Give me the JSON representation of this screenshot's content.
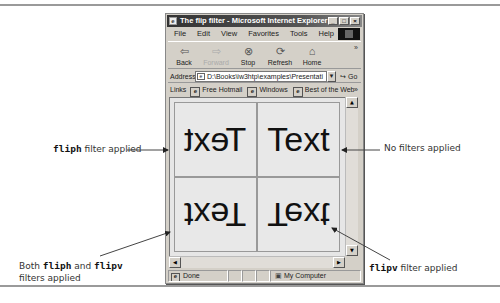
{
  "window": {
    "title": "The flip filter - Microsoft Internet Explorer",
    "buttons": [
      "_",
      "□",
      "×"
    ]
  },
  "menu": [
    "File",
    "Edit",
    "View",
    "Favorites",
    "Tools",
    "Help"
  ],
  "toolbar": {
    "back": {
      "label": "Back",
      "icon": "back-arrow-icon"
    },
    "forward": {
      "label": "Forward",
      "icon": "forward-arrow-icon"
    },
    "stop": {
      "label": "Stop",
      "icon": "stop-icon"
    },
    "refresh": {
      "label": "Refresh",
      "icon": "refresh-icon"
    },
    "home": {
      "label": "Home",
      "icon": "home-icon"
    },
    "more": "»"
  },
  "address": {
    "label": "Address",
    "value": "D:\\Books\\iw3htp\\examples\\Presentati",
    "go": "Go"
  },
  "links": {
    "label": "Links",
    "items": [
      "Free Hotmail",
      "Windows",
      "Best of the Web"
    ],
    "more": "»"
  },
  "content": {
    "cells": [
      {
        "text": "Text",
        "filter": "fliph"
      },
      {
        "text": "Text",
        "filter": "none"
      },
      {
        "text": "Text",
        "filter": "fliph flipv"
      },
      {
        "text": "Text",
        "filter": "flipv"
      }
    ]
  },
  "statusbar": {
    "status": "Done",
    "zone": "My Computer"
  },
  "annotations": {
    "fliph": {
      "code": "fliph",
      "text": " filter applied"
    },
    "none": {
      "text": "No filters applied"
    },
    "both": {
      "pre": "Both ",
      "code1": "fliph",
      "mid": " and ",
      "code2": "flipv",
      "line2": "filters applied"
    },
    "flipv": {
      "code": "flipv",
      "text": " filter applied"
    }
  }
}
